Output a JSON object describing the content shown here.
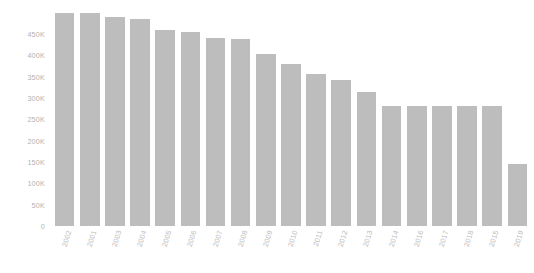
{
  "chart_data": {
    "type": "bar",
    "title": "",
    "subtitle": "",
    "xlabel": "",
    "ylabel": "",
    "categories": [
      "2002",
      "2001",
      "2003",
      "2004",
      "2005",
      "2006",
      "2007",
      "2008",
      "2009",
      "2010",
      "2011",
      "2012",
      "2013",
      "2014",
      "2016",
      "2017",
      "2018",
      "2015",
      "2019"
    ],
    "values": [
      500000,
      500000,
      490000,
      485000,
      460000,
      455000,
      440000,
      437000,
      404000,
      380000,
      357000,
      343000,
      315000,
      282000,
      281000,
      281000,
      281000,
      281000,
      145000
    ],
    "ytick_labels": [
      "0",
      "50K",
      "100K",
      "150K",
      "200K",
      "250K",
      "300K",
      "350K",
      "400K",
      "450K"
    ],
    "ytick_values": [
      0,
      50000,
      100000,
      150000,
      200000,
      250000,
      300000,
      350000,
      400000,
      450000
    ],
    "ylim": [
      0,
      520000
    ],
    "grid": false,
    "legend": null,
    "bar_color": "#bdbdbd",
    "axis_text_color": "#b8b8b8",
    "background": "#ffffff"
  }
}
